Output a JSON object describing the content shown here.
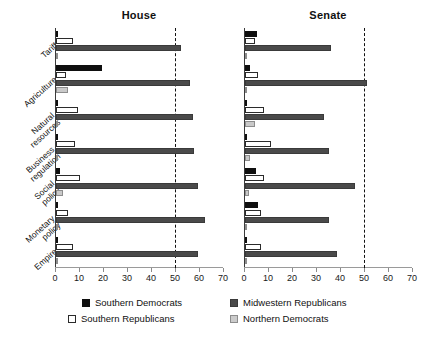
{
  "chart_data": {
    "type": "bar",
    "orientation": "horizontal",
    "title": "",
    "panels": [
      {
        "name": "house",
        "label": "House",
        "xlabel": "",
        "ylabel": "",
        "xlim": [
          0,
          70
        ],
        "xticks": [
          0,
          10,
          20,
          30,
          40,
          50,
          60,
          70
        ],
        "threshold": 50,
        "grid": false,
        "categories": [
          "Tariff",
          "Agriculture",
          "Natural\nresources",
          "Business\nregulation",
          "Social\npolicy",
          "Monetary\npolicy",
          "Empire"
        ],
        "series": [
          {
            "name": "Southern Democrats",
            "key": "sd",
            "color": "#0f0f0f",
            "values": [
              0,
              19,
              1,
              0,
              1.5,
              0.5,
              0
            ]
          },
          {
            "name": "Southern Republicans",
            "key": "sr",
            "color": "#ffffff",
            "values": [
              7,
              4,
              9,
              8,
              10,
              5,
              7
            ]
          },
          {
            "name": "Midwestern Republicans",
            "key": "mr",
            "color": "#4a4a4a",
            "values": [
              52,
              56,
              57,
              57.5,
              59,
              62,
              59
            ]
          },
          {
            "name": "Northern Democrats",
            "key": "nd",
            "color": "#c9c9c9",
            "values": [
              0,
              5,
              0.5,
              0,
              3,
              0.3,
              1
            ]
          }
        ]
      },
      {
        "name": "senate",
        "label": "Senate",
        "xlabel": "",
        "ylabel": "",
        "xlim": [
          0,
          70
        ],
        "xticks": [
          0,
          10,
          20,
          30,
          40,
          50,
          60,
          70
        ],
        "threshold": 50,
        "grid": false,
        "categories": [
          "Tariff",
          "Agriculture",
          "Natural\nresources",
          "Business\nregulation",
          "Social\npolicy",
          "Monetary\npolicy",
          "Empire"
        ],
        "series": [
          {
            "name": "Southern Democrats",
            "key": "sd",
            "color": "#0f0f0f",
            "values": [
              5,
              2,
              1,
              0,
              4.5,
              5.5,
              0
            ]
          },
          {
            "name": "Southern Republicans",
            "key": "sr",
            "color": "#ffffff",
            "values": [
              4,
              5.5,
              8,
              11,
              8,
              6.5,
              6.5
            ]
          },
          {
            "name": "Midwestern Republicans",
            "key": "mr",
            "color": "#4a4a4a",
            "values": [
              36,
              51,
              33,
              35,
              46,
              35,
              38.5
            ]
          },
          {
            "name": "Northern Democrats",
            "key": "nd",
            "color": "#c9c9c9",
            "values": [
              0,
              0,
              4,
              2,
              1.5,
              0,
              0
            ]
          }
        ]
      }
    ],
    "legend": {
      "position": "bottom",
      "entries": [
        {
          "key": "sd",
          "label": "Southern Democrats",
          "color": "#0f0f0f"
        },
        {
          "key": "sr",
          "label": "Southern Republicans",
          "color": "#ffffff"
        },
        {
          "key": "mr",
          "label": "Midwestern Republicans",
          "color": "#4a4a4a"
        },
        {
          "key": "nd",
          "label": "Northern Democrats",
          "color": "#c9c9c9"
        }
      ]
    }
  },
  "legend_labels": {
    "southern_democrats": "Southern Democrats",
    "southern_republicans": "Southern Republicans",
    "midwestern_republicans": "Midwestern Republicans",
    "northern_democrats": "Northern Democrats"
  },
  "panel_titles": {
    "house": "House",
    "senate": "Senate"
  }
}
